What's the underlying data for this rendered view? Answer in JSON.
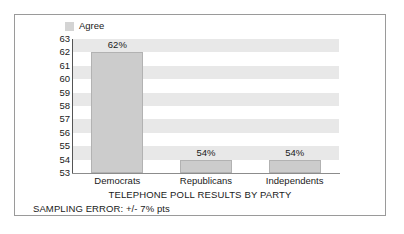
{
  "chart_data": {
    "type": "bar",
    "title": "TELEPHONE POLL RESULTS BY PARTY",
    "subtitle": "",
    "xlabel": "",
    "ylabel": "",
    "categories": [
      "Democrats",
      "Republicans",
      "Independents"
    ],
    "values": [
      62,
      54,
      54
    ],
    "data_labels": [
      "62%",
      "54%",
      "54%"
    ],
    "ylim": [
      53,
      63
    ],
    "ytick_labels": [
      "63",
      "62",
      "61",
      "60",
      "59",
      "58",
      "57",
      "56",
      "55",
      "54",
      "53"
    ],
    "grid": "horizontal-banding",
    "legend": {
      "position": "top-left",
      "entries": [
        {
          "label": "Agree",
          "color": "#d4d4d4",
          "swatch_name": "legend-swatch-agree"
        }
      ]
    },
    "annotations": [
      "SAMPLING ERROR: +/- 7% pts"
    ],
    "colors": {
      "bar_fill": "#cccccc",
      "bar_border": "#b2b2b2",
      "band": "#e8e8e8",
      "axis": "#555555",
      "frame": "#9a9a9a",
      "text": "#1a1a1a"
    }
  },
  "footnote": {
    "text": "SAMPLING ERROR: +/- 7% pts"
  }
}
